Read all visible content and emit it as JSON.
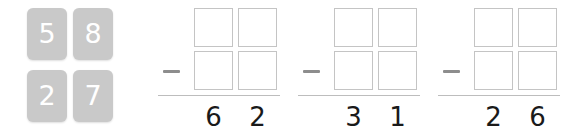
{
  "canvas": {
    "background": "#ffffff",
    "width": 587,
    "height": 138
  },
  "tile_panel": {
    "name": "digit-tile-palette",
    "tile_color": "#c9c9c9",
    "digit_color": "#ffffff",
    "rows": [
      [
        "5",
        "8"
      ],
      [
        "2",
        "7"
      ]
    ],
    "tiles": [
      {
        "value": "5",
        "row": 0,
        "col": 0
      },
      {
        "value": "8",
        "row": 0,
        "col": 1
      },
      {
        "value": "2",
        "row": 1,
        "col": 0
      },
      {
        "value": "7",
        "row": 1,
        "col": 1
      }
    ]
  },
  "problems": [
    {
      "operator": "−",
      "operator_color": "#8d8d8d",
      "cells": [
        {
          "row": 0,
          "col": 0,
          "value": ""
        },
        {
          "row": 0,
          "col": 1,
          "value": ""
        },
        {
          "row": 1,
          "col": 0,
          "value": ""
        },
        {
          "row": 1,
          "col": 1,
          "value": ""
        }
      ],
      "result": [
        "6",
        "2"
      ],
      "result_color": "#1a1a1a",
      "rule_color": "#bdbdbd"
    },
    {
      "operator": "−",
      "operator_color": "#8d8d8d",
      "cells": [
        {
          "row": 0,
          "col": 0,
          "value": ""
        },
        {
          "row": 0,
          "col": 1,
          "value": ""
        },
        {
          "row": 1,
          "col": 0,
          "value": ""
        },
        {
          "row": 1,
          "col": 1,
          "value": ""
        }
      ],
      "result": [
        "3",
        "1"
      ],
      "result_color": "#1a1a1a",
      "rule_color": "#bdbdbd"
    },
    {
      "operator": "−",
      "operator_color": "#8d8d8d",
      "cells": [
        {
          "row": 0,
          "col": 0,
          "value": ""
        },
        {
          "row": 0,
          "col": 1,
          "value": ""
        },
        {
          "row": 1,
          "col": 0,
          "value": ""
        },
        {
          "row": 1,
          "col": 1,
          "value": ""
        }
      ],
      "result": [
        "2",
        "6"
      ],
      "result_color": "#1a1a1a",
      "rule_color": "#bdbdbd"
    }
  ]
}
